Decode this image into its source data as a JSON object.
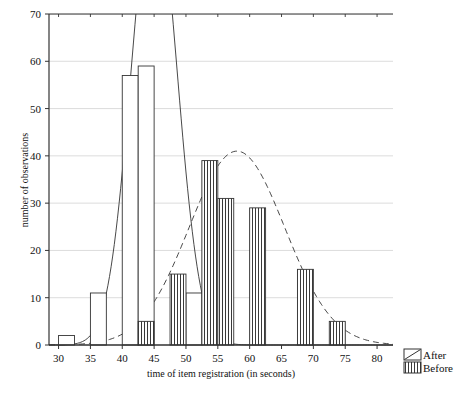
{
  "chart_data": {
    "type": "bar",
    "title": "",
    "subtitle": "",
    "xlabel": "time of item registration (in seconds)",
    "ylabel": "number of observations",
    "xlim": [
      28.5,
      82.5
    ],
    "ylim": [
      0,
      70
    ],
    "xticks": [
      30,
      35,
      40,
      45,
      50,
      55,
      60,
      65,
      70,
      75,
      80
    ],
    "yticks": [
      0,
      10,
      20,
      30,
      40,
      50,
      60,
      70
    ],
    "xtick_labels": [
      "30",
      "35",
      "40",
      "45",
      "50",
      "55",
      "60",
      "65",
      "70",
      "75",
      "80"
    ],
    "ytick_labels": [
      "0",
      "10",
      "20",
      "30",
      "40",
      "50",
      "60",
      "70"
    ],
    "grid": true,
    "grid_axis": "y",
    "bin_width": 2.5,
    "legend_position": "bottom-right",
    "legend": [
      "After",
      "Before"
    ],
    "series": [
      {
        "name": "After",
        "style": "open",
        "bars": [
          {
            "x0": 30.0,
            "x1": 32.5,
            "value": 2
          },
          {
            "x0": 35.0,
            "x1": 37.5,
            "value": 11
          },
          {
            "x0": 40.0,
            "x1": 42.5,
            "value": 57
          },
          {
            "x0": 42.5,
            "x1": 45.0,
            "value": 59
          },
          {
            "x0": 50.0,
            "x1": 52.5,
            "value": 11
          }
        ],
        "curve": {
          "name": "After fitted normal",
          "style": "solid",
          "mean": 45.0,
          "peak_value": 96,
          "sd": 3.6
        }
      },
      {
        "name": "Before",
        "style": "vertical-hatch",
        "bars": [
          {
            "x0": 42.5,
            "x1": 45.0,
            "value": 5
          },
          {
            "x0": 47.5,
            "x1": 50.0,
            "value": 15
          },
          {
            "x0": 52.5,
            "x1": 55.0,
            "value": 39
          },
          {
            "x0": 55.0,
            "x1": 57.5,
            "value": 31
          },
          {
            "x0": 60.0,
            "x1": 62.5,
            "value": 29
          },
          {
            "x0": 67.5,
            "x1": 70.0,
            "value": 16
          },
          {
            "x0": 72.5,
            "x1": 75.0,
            "value": 5
          }
        ],
        "curve": {
          "name": "Before fitted normal",
          "style": "dashed",
          "mean": 58.0,
          "peak_value": 41,
          "sd": 7.5
        }
      }
    ],
    "colors": {
      "axis": "#333333",
      "grid": "#d8d8d8",
      "bar_outline": "#333333",
      "bar_fill": "#ffffff",
      "curve": "#333333"
    }
  },
  "axes": {
    "y_title": "number of observations",
    "x_title": "time of item registration (in seconds)"
  },
  "legend": {
    "items": [
      {
        "label": "After",
        "swatch": "diagonal-swatch"
      },
      {
        "label": "Before",
        "swatch": "vertical-hatch-swatch"
      }
    ]
  }
}
